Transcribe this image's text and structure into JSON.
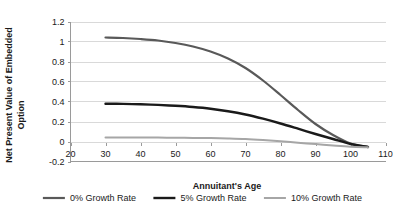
{
  "chart_data": {
    "type": "line",
    "title": "",
    "xlabel": "Annuitant's Age",
    "ylabel": "Net Present Value of Embedded Option",
    "ylabel_line1": "Net Present Value of Embedded",
    "ylabel_line2": "Option",
    "xlim": [
      20,
      110
    ],
    "ylim": [
      -0.2,
      1.2
    ],
    "xticks": [
      20,
      30,
      40,
      50,
      60,
      70,
      80,
      90,
      100,
      110
    ],
    "xtick_labels": [
      "20",
      "30",
      "40",
      "50",
      "60",
      "70",
      "80",
      "90",
      "100",
      "110"
    ],
    "yticks": [
      -0.2,
      0,
      0.2,
      0.4,
      0.6,
      0.8,
      1,
      1.2
    ],
    "ytick_labels": [
      "-0.2",
      "0",
      "0.2",
      "0.4",
      "0.6",
      "0.8",
      "1",
      "1.2"
    ],
    "grid": "horizontal",
    "legend_position": "bottom",
    "x": [
      30,
      35,
      40,
      45,
      50,
      55,
      60,
      65,
      70,
      75,
      80,
      85,
      90,
      95,
      100,
      105
    ],
    "series": [
      {
        "name": "0% Growth Rate",
        "color": "#595959",
        "width": 2.2,
        "values": [
          1.04,
          1.035,
          1.025,
          1.01,
          0.985,
          0.95,
          0.9,
          0.83,
          0.735,
          0.61,
          0.465,
          0.315,
          0.175,
          0.065,
          -0.02,
          -0.055
        ]
      },
      {
        "name": "5% Growth Rate",
        "color": "#1a1a1a",
        "width": 2.4,
        "values": [
          0.378,
          0.376,
          0.372,
          0.366,
          0.357,
          0.345,
          0.328,
          0.303,
          0.27,
          0.228,
          0.18,
          0.128,
          0.075,
          0.025,
          -0.025,
          -0.055
        ]
      },
      {
        "name": "10% Growth Rate",
        "color": "#a6a6a6",
        "width": 2.0,
        "values": [
          0.04,
          0.04,
          0.04,
          0.039,
          0.038,
          0.036,
          0.034,
          0.03,
          0.024,
          0.014,
          0.002,
          -0.012,
          -0.026,
          -0.04,
          -0.052,
          -0.058
        ]
      }
    ],
    "legend": [
      {
        "label": "0% Growth Rate",
        "color": "#595959"
      },
      {
        "label": "5% Growth Rate",
        "color": "#1a1a1a"
      },
      {
        "label": "10% Growth Rate",
        "color": "#a6a6a6"
      }
    ]
  }
}
